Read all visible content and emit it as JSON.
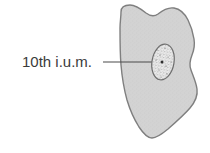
{
  "figure": {
    "type": "anatomical-diagram",
    "background_color": "#ffffff",
    "width": 210,
    "height": 153,
    "annotations": [
      {
        "name": "segment-label",
        "text": "10th i.u.m.",
        "text_color": "#3b3b3b",
        "leader_line_color": "#4a4a4a"
      }
    ],
    "structures": [
      {
        "name": "tissue-outline",
        "description": "irregular tapered cell body cross-section",
        "fill_color": "#d3d3d3",
        "stroke_color": "#7f7f7f"
      },
      {
        "name": "nucleus",
        "description": "tilted oval nucleus with stippled chromatin",
        "fill_color": "#ededed",
        "stroke_color": "#6e6e6e",
        "stipple_color": "#6b6b6b"
      },
      {
        "name": "nucleolus",
        "description": "small dark dot inside nucleus",
        "fill_color": "#2e2e2e"
      }
    ]
  }
}
